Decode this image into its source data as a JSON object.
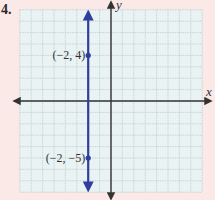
{
  "problem": {
    "number": "4."
  },
  "colors": {
    "page_background": "#fbe9e7",
    "grid_background": "#e9f3f3",
    "grid_line": "#b9c6c8",
    "axis": "#333333",
    "line": "#2f3d9c"
  },
  "chart_data": {
    "type": "line",
    "title": "",
    "xlabel": "x",
    "ylabel": "y",
    "xlim": [
      -8,
      8
    ],
    "ylim": [
      -8,
      8
    ],
    "grid": true,
    "series": [
      {
        "name": "x = -2",
        "description": "Vertical line through x = -2 with arrows at both ends",
        "x": [
          -2,
          -2
        ],
        "y": [
          -8,
          8
        ]
      }
    ],
    "points": [
      {
        "x": -2,
        "y": 4,
        "label": "(−2, 4)"
      },
      {
        "x": -2,
        "y": -5,
        "label": "(−2, −5)"
      }
    ]
  }
}
